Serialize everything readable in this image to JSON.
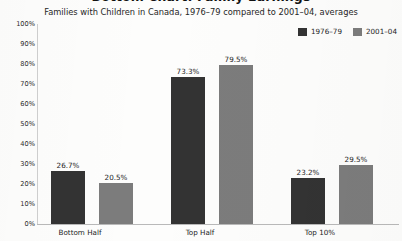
{
  "chart_data": {
    "type": "bar",
    "title": "Bottom Chart: Family Earnings",
    "subtitle": "Families with Children in Canada, 1976–79 compared to 2001–04, averages",
    "categories": [
      "Bottom Half",
      "Top Half",
      "Top 10%"
    ],
    "series": [
      {
        "name": "1976–79",
        "color": "#333333",
        "values": [
          26.7,
          73.3,
          23.2
        ],
        "labels": [
          "26.7%",
          "73.3%",
          "23.2%"
        ]
      },
      {
        "name": "2001–04",
        "color": "#7c7c7c",
        "values": [
          20.5,
          79.5,
          29.5
        ],
        "labels": [
          "20.5%",
          "79.5%",
          "29.5%"
        ]
      }
    ],
    "xlabel": "",
    "ylabel": "",
    "ylim": [
      0,
      100
    ],
    "yticks": [
      "100%",
      "90%",
      "80%",
      "70%",
      "60%",
      "50%",
      "40%",
      "30%",
      "20%",
      "10%",
      "0%"
    ],
    "ytick_values": [
      100,
      90,
      80,
      70,
      60,
      50,
      40,
      30,
      20,
      10,
      0
    ],
    "grid": false,
    "legend_position": "top-right"
  }
}
